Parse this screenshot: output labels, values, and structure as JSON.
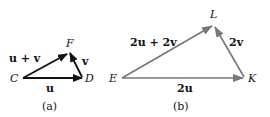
{
  "figure_a": {
    "caption": "(a)",
    "points": {
      "C": {
        "label": "C",
        "x": 22,
        "y": 78
      },
      "D": {
        "label": "D",
        "x": 83,
        "y": 78
      },
      "F": {
        "label": "F",
        "x": 69,
        "y": 51
      }
    },
    "vectors": [
      {
        "name": "u",
        "from": "C",
        "to": "D",
        "label": "u"
      },
      {
        "name": "v",
        "from": "D",
        "to": "F",
        "label": "v"
      },
      {
        "name": "u+v",
        "from": "C",
        "to": "F",
        "label": "u + v"
      }
    ],
    "labels": {
      "u": "u",
      "v": "v",
      "uv": "u + v"
    },
    "color": "#111111"
  },
  "figure_b": {
    "caption": "(b)",
    "points": {
      "E": {
        "label": "E",
        "x": 121,
        "y": 78
      },
      "K": {
        "label": "K",
        "x": 244,
        "y": 78
      },
      "L": {
        "label": "L",
        "x": 214,
        "y": 24
      }
    },
    "vectors": [
      {
        "name": "2u",
        "from": "E",
        "to": "K",
        "label": "2u"
      },
      {
        "name": "2v",
        "from": "K",
        "to": "L",
        "label": "2v"
      },
      {
        "name": "2u+2v",
        "from": "E",
        "to": "L",
        "label": "2u + 2v"
      }
    ],
    "labels": {
      "two_u": "2u",
      "two_v": "2v",
      "two_uv": "2u + 2v"
    },
    "color": "#777777"
  }
}
